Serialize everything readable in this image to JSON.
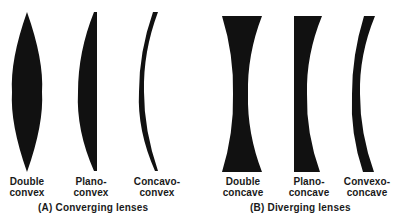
{
  "diagram": {
    "type": "lens-classification",
    "ink_color": "#111111",
    "background": "#ffffff"
  },
  "groups": [
    {
      "id": "converging",
      "caption": "(A) Converging lenses",
      "lenses": [
        {
          "line1": "Double",
          "line2": "convex"
        },
        {
          "line1": "Plano-",
          "line2": "convex"
        },
        {
          "line1": "Concavo-",
          "line2": "convex"
        }
      ]
    },
    {
      "id": "diverging",
      "caption": "(B) Diverging lenses",
      "lenses": [
        {
          "line1": "Double",
          "line2": "concave"
        },
        {
          "line1": "Plano-",
          "line2": "concave"
        },
        {
          "line1": "Convexo-",
          "line2": "concave"
        }
      ]
    }
  ]
}
